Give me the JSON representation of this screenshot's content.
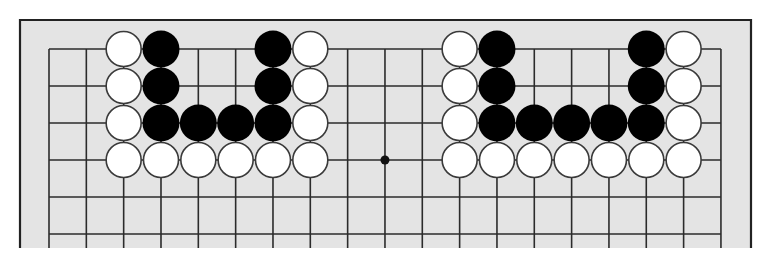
{
  "diagram": {
    "type": "go-board-partial",
    "colors": {
      "page_background": "#ffffff",
      "board_fill": "#e4e4e4",
      "frame": "#222222",
      "grid_line": "#2b2b2b",
      "black_stone": "#000000",
      "white_stone": "#ffffff",
      "white_stone_outline": "#3a3a3a",
      "star_point": "#111111"
    },
    "frame": {
      "left": 20,
      "top": 20,
      "right": 751,
      "bottom": 248,
      "open_bottom": true
    },
    "grid": {
      "columns": 19,
      "rows_visible": 6,
      "origin_x": 49,
      "origin_y": 49,
      "spacing_x": 37.33,
      "spacing_y": 37,
      "extends_below": 248
    },
    "star_points": [
      {
        "col": 10,
        "row": 4
      }
    ],
    "stones": [
      {
        "color": "white",
        "col": 3,
        "row": 1
      },
      {
        "color": "white",
        "col": 3,
        "row": 2
      },
      {
        "color": "white",
        "col": 3,
        "row": 3
      },
      {
        "color": "white",
        "col": 3,
        "row": 4
      },
      {
        "color": "white",
        "col": 4,
        "row": 4
      },
      {
        "color": "white",
        "col": 5,
        "row": 4
      },
      {
        "color": "white",
        "col": 6,
        "row": 4
      },
      {
        "color": "white",
        "col": 7,
        "row": 4
      },
      {
        "color": "white",
        "col": 8,
        "row": 4
      },
      {
        "color": "white",
        "col": 8,
        "row": 3
      },
      {
        "color": "white",
        "col": 8,
        "row": 2
      },
      {
        "color": "white",
        "col": 8,
        "row": 1
      },
      {
        "color": "black",
        "col": 4,
        "row": 1
      },
      {
        "color": "black",
        "col": 4,
        "row": 2
      },
      {
        "color": "black",
        "col": 4,
        "row": 3
      },
      {
        "color": "black",
        "col": 5,
        "row": 3
      },
      {
        "color": "black",
        "col": 6,
        "row": 3
      },
      {
        "color": "black",
        "col": 7,
        "row": 3
      },
      {
        "color": "black",
        "col": 7,
        "row": 2
      },
      {
        "color": "black",
        "col": 7,
        "row": 1
      },
      {
        "color": "white",
        "col": 12,
        "row": 1
      },
      {
        "color": "white",
        "col": 12,
        "row": 2
      },
      {
        "color": "white",
        "col": 12,
        "row": 3
      },
      {
        "color": "white",
        "col": 12,
        "row": 4
      },
      {
        "color": "white",
        "col": 13,
        "row": 4
      },
      {
        "color": "white",
        "col": 14,
        "row": 4
      },
      {
        "color": "white",
        "col": 15,
        "row": 4
      },
      {
        "color": "white",
        "col": 16,
        "row": 4
      },
      {
        "color": "white",
        "col": 17,
        "row": 4
      },
      {
        "color": "white",
        "col": 18,
        "row": 4
      },
      {
        "color": "white",
        "col": 18,
        "row": 3
      },
      {
        "color": "white",
        "col": 18,
        "row": 2
      },
      {
        "color": "white",
        "col": 18,
        "row": 1
      },
      {
        "color": "black",
        "col": 13,
        "row": 1
      },
      {
        "color": "black",
        "col": 13,
        "row": 2
      },
      {
        "color": "black",
        "col": 13,
        "row": 3
      },
      {
        "color": "black",
        "col": 14,
        "row": 3
      },
      {
        "color": "black",
        "col": 15,
        "row": 3
      },
      {
        "color": "black",
        "col": 16,
        "row": 3
      },
      {
        "color": "black",
        "col": 17,
        "row": 3
      },
      {
        "color": "black",
        "col": 17,
        "row": 2
      },
      {
        "color": "black",
        "col": 17,
        "row": 1
      }
    ]
  }
}
